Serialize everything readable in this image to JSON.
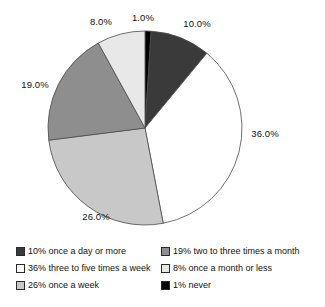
{
  "chart_data": {
    "type": "pie",
    "title": "",
    "subtitle": "",
    "xlabel": "",
    "ylabel": "",
    "grid": false,
    "legend_position": "bottom",
    "startangle": 90,
    "counterclock": false,
    "categories": [
      "1% never",
      "10% once a day or more",
      "36% three to five times a week",
      "26% once a week",
      "19% two to three times a month",
      "8% once a month or less"
    ],
    "values": [
      1.0,
      10.0,
      36.0,
      26.0,
      19.0,
      8.0
    ],
    "value_labels": [
      "1.0%",
      "10.0%",
      "36.0%",
      "26.0%",
      "19.0%",
      "8.0%"
    ],
    "colors": [
      "#000000",
      "#3a3a3a",
      "#ffffff",
      "#c8c8c8",
      "#8e8e8e",
      "#e8e8e8"
    ],
    "edge_color": "#4a4a4a",
    "slices": [
      {
        "label": "1% never",
        "value": 1.0,
        "value_label": "1.0%",
        "color": "#000000"
      },
      {
        "label": "10% once a day or more",
        "value": 10.0,
        "value_label": "10.0%",
        "color": "#3a3a3a"
      },
      {
        "label": "36% three to five times a week",
        "value": 36.0,
        "value_label": "36.0%",
        "color": "#ffffff"
      },
      {
        "label": "26% once a week",
        "value": 26.0,
        "value_label": "26.0%",
        "color": "#c8c8c8"
      },
      {
        "label": "19% two to three times a month",
        "value": 19.0,
        "value_label": "19.0%",
        "color": "#8e8e8e"
      },
      {
        "label": "8% once a month or less",
        "value": 8.0,
        "value_label": "8.0%",
        "color": "#e8e8e8"
      }
    ]
  },
  "pie": {
    "labels": {
      "never": "1.0%",
      "once_a_day_or_more": "10.0%",
      "three_to_five_times_a_week": "36.0%",
      "once_a_week": "26.0%",
      "two_to_three_times_a_month": "19.0%",
      "once_a_month_or_less": "8.0%"
    }
  },
  "legend": {
    "left_column": [
      {
        "label": "10% once a day or more",
        "color": "#3a3a3a"
      },
      {
        "label": "36% three to five times a week",
        "color": "#ffffff"
      },
      {
        "label": "26% once a week",
        "color": "#c8c8c8"
      }
    ],
    "right_column": [
      {
        "label": "19% two to three times a month",
        "color": "#8e8e8e"
      },
      {
        "label": "8% once a month or less",
        "color": "#e8e8e8"
      },
      {
        "label": "1% never",
        "color": "#000000"
      }
    ]
  }
}
